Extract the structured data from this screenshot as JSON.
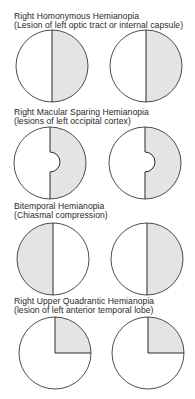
{
  "figure": {
    "colors": {
      "field_fill": "#e4e4e4",
      "outline": "#3a3a3a",
      "background": "#ffffff"
    },
    "panels": [
      {
        "title": "Right Homonymous Hemianopia",
        "subtitle": "(Lesion of left optic tract or internal capsule)",
        "pattern": "right-half-shaded",
        "eyes": [
          "left-eye",
          "right-eye"
        ]
      },
      {
        "title": "Right Macular Sparing Hemianopia",
        "subtitle": "(lesions of left occipital cortex)",
        "pattern": "right-half-shaded-macula-spared",
        "eyes": [
          "left-eye",
          "right-eye"
        ]
      },
      {
        "title": "Bitemporal Hemianopia",
        "subtitle": "(Chiasmal compression)",
        "pattern": "temporal-halves-shaded",
        "eyes": [
          "left-eye",
          "right-eye"
        ]
      },
      {
        "title": "Right Upper Quadrantic Hemianopia",
        "subtitle": "(lesion of left anterior temporal lobe)",
        "pattern": "right-upper-quadrant-shaded",
        "eyes": [
          "left-eye",
          "right-eye"
        ]
      }
    ]
  }
}
